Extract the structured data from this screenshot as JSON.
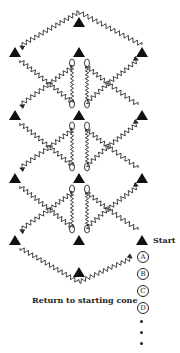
{
  "diagram": {
    "start_label": "Start",
    "return_label": "Return to starting cone",
    "players": [
      "A",
      "B",
      "C",
      "D"
    ],
    "continuation": "...",
    "colors": {
      "line": "#2a2a2a",
      "cone": "#111111",
      "text": "#222222"
    },
    "cones": [
      {
        "id": "top",
        "x": 79,
        "y": 22
      },
      {
        "id": "r1-left",
        "x": 15,
        "y": 52
      },
      {
        "id": "r1-center",
        "x": 79,
        "y": 52
      },
      {
        "id": "r1-right",
        "x": 142,
        "y": 52
      },
      {
        "id": "r2-left",
        "x": 15,
        "y": 115
      },
      {
        "id": "r2-center",
        "x": 79,
        "y": 115
      },
      {
        "id": "r2-right",
        "x": 142,
        "y": 115
      },
      {
        "id": "r3-left",
        "x": 15,
        "y": 178
      },
      {
        "id": "r3-center",
        "x": 79,
        "y": 178
      },
      {
        "id": "r3-right",
        "x": 142,
        "y": 178
      },
      {
        "id": "r4-left",
        "x": 15,
        "y": 240
      },
      {
        "id": "r4-center",
        "x": 79,
        "y": 240
      },
      {
        "id": "start",
        "x": 142,
        "y": 240
      },
      {
        "id": "bottom",
        "x": 79,
        "y": 272
      }
    ]
  }
}
